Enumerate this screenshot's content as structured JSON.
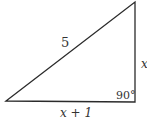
{
  "diagram": {
    "type": "right-triangle",
    "labels": {
      "hypotenuse": "5",
      "vertical_side": "x",
      "horizontal_side": "x + 1",
      "right_angle": "90°"
    },
    "colors": {
      "stroke": "#2b2b2b",
      "text": "#333333",
      "background": "#ffffff"
    }
  }
}
